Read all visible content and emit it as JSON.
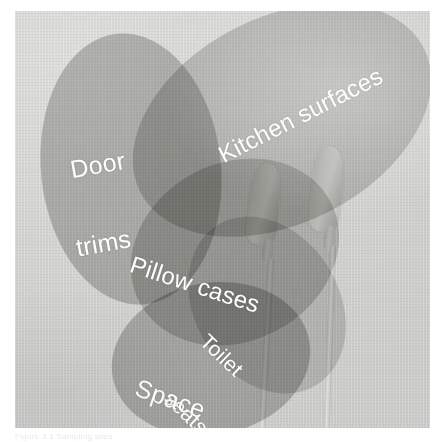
{
  "figure": {
    "kind": "venn-ellipse-overlay-on-photograph",
    "caption": "Figure 3.1  Sampling sites",
    "background_color": "#d3d3d1",
    "plate_border_color": "#c9c9c7",
    "label_color": "#ffffff"
  },
  "photo": {
    "subject": "two cotton swabs",
    "swabs": [
      {
        "name": "swab-left",
        "tip_color": "#dcdcd9",
        "stick_color": "#d4d4d1"
      },
      {
        "name": "swab-right",
        "tip_color": "#dcdcd9",
        "stick_color": "#d4d4d1"
      }
    ]
  },
  "diagram": {
    "type": "venn",
    "set_count": 4,
    "sets": [
      {
        "id": "door-trims",
        "label": "Door\ntrims",
        "label_line_1": "Door",
        "label_line_2": "trims",
        "fill": "#aeaeac",
        "opacity": 0.55,
        "rotation_deg": -8
      },
      {
        "id": "kitchen-surfaces",
        "label": "Kitchen surfaces",
        "fill": "#b4b4b1",
        "opacity": 0.5,
        "rotation_deg": -28
      },
      {
        "id": "pillow-cases",
        "label": "Pillow cases",
        "fill": "#b0b0ad",
        "opacity": 0.5,
        "rotation_deg": -30
      },
      {
        "id": "toilet-seats",
        "label": "Toilet\nseats",
        "label_line_1": "Toilet",
        "label_line_2": "seats",
        "fill": "#b6b6b3",
        "opacity": 0.45,
        "rotation_deg": -35
      },
      {
        "id": "space-station",
        "label": "Space\nstation",
        "label_line_1": "Space",
        "label_line_2": "station",
        "fill": "#aaaaa7",
        "opacity": 0.55,
        "rotation_deg": -12
      }
    ]
  },
  "labels": {
    "door_trims_1": "Door",
    "door_trims_2": "trims",
    "kitchen_surfaces": "Kitchen surfaces",
    "pillow_cases": "Pillow cases",
    "toilet_seats_1": "Toilet",
    "toilet_seats_2": "seats",
    "space_station_1": "Space",
    "space_station_2": "station"
  }
}
